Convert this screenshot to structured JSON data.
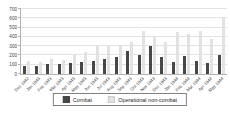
{
  "chart_data": {
    "type": "bar",
    "title": "",
    "xlabel": "",
    "ylabel": "",
    "ylim": [
      0,
      700
    ],
    "ytick_step": 100,
    "grid": true,
    "legend_position": "bottom",
    "categories": [
      "Dec 1942",
      "Jan 1943",
      "Feb 1943",
      "Mar 1943",
      "Apr 1943",
      "May 1943",
      "Jun 1943",
      "Jul 1943",
      "Aug 1943",
      "Sep 1943",
      "Oct 1943",
      "Nov 1943",
      "Dec 1943",
      "Jan 1944",
      "Feb 1944",
      "Mar 1944",
      "Apr 1944",
      "May 1944"
    ],
    "series": [
      {
        "name": "Combat",
        "color": "#474747",
        "values": [
          90,
          85,
          105,
          110,
          115,
          130,
          140,
          165,
          180,
          250,
          200,
          300,
          180,
          130,
          190,
          145,
          120,
          210
        ]
      },
      {
        "name": "Operational non-combat",
        "color": "#e2e2e2",
        "values": [
          135,
          130,
          165,
          150,
          210,
          235,
          300,
          310,
          310,
          350,
          465,
          410,
          340,
          450,
          430,
          460,
          375,
          610
        ]
      }
    ],
    "colors": {
      "gridline": "#e3e3e3",
      "axis": "#b3b3b3",
      "text": "#404040",
      "legend_border": "#808080"
    }
  }
}
